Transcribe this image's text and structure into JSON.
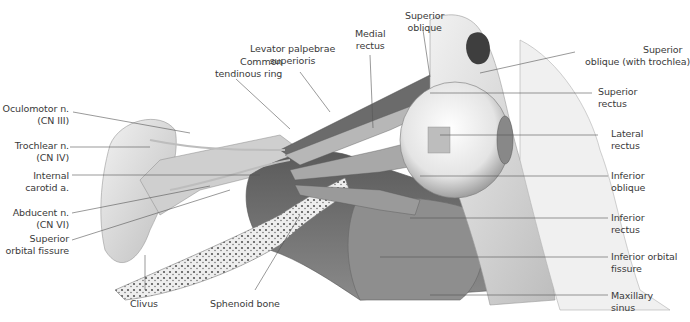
{
  "figure": {
    "colors": {
      "background": "#ffffff",
      "label_text": "#3a3a3a",
      "leader_line": "#555555",
      "bone": "#e8e8e8",
      "shadow": "#6a6a6a"
    }
  },
  "labels": {
    "common_tendinous_ring": {
      "line1": "Common",
      "line2": "tendinous ring"
    },
    "levator": {
      "line1": "Levator palpebrae",
      "line2": "superioris"
    },
    "medial_rectus": {
      "line1": "Medial",
      "line2": "rectus"
    },
    "superior_oblique": {
      "line1": "Superior",
      "line2": "oblique"
    },
    "superior_oblique_trochlea": {
      "line1": "Superior",
      "line2": "oblique (with trochlea)"
    },
    "superior_rectus": {
      "line1": "Superior",
      "line2": "rectus"
    },
    "lateral_rectus": {
      "line1": "Lateral",
      "line2": "rectus"
    },
    "inferior_oblique": {
      "line1": "Inferior",
      "line2": "oblique"
    },
    "inferior_rectus": {
      "line1": "Inferior",
      "line2": "rectus"
    },
    "inferior_orbital_fissure": {
      "line1": "Inferior orbital",
      "line2": "fissure"
    },
    "maxillary_sinus": {
      "line1": "Maxillary",
      "line2": "sinus"
    },
    "oculomotor": {
      "line1": "Oculomotor n.",
      "line2": "(CN III)"
    },
    "trochlear": {
      "line1": "Trochlear n.",
      "line2": "(CN IV)"
    },
    "internal_carotid": {
      "line1": "Internal",
      "line2": "carotid a."
    },
    "abducent": {
      "line1": "Abducent n.",
      "line2": "(CN VI)"
    },
    "superior_orbital_fissure": {
      "line1": "Superior",
      "line2": "orbital fissure"
    },
    "clivus": {
      "line1": "Clivus"
    },
    "sphenoid_bone": {
      "line1": "Sphenoid bone"
    }
  }
}
